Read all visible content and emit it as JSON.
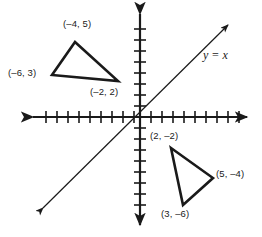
{
  "figure": {
    "name": "coordinate-plane-reflection-diagram",
    "background_color": "#ffffff",
    "stroke_color": "#1a1a1a",
    "width": 262,
    "height": 237
  },
  "axes": {
    "origin_px": [
      140,
      117
    ],
    "tick_spacing_px": 11,
    "x_axis": {
      "label": "",
      "arrow_left_px": [
        31,
        117
      ],
      "arrow_right_px": [
        249,
        117
      ],
      "tick_count_left": 9,
      "tick_count_right": 9
    },
    "y_axis": {
      "label": "",
      "arrow_top_px": [
        140,
        12
      ],
      "arrow_bottom_px": [
        140,
        227
      ],
      "tick_count_up": 8,
      "tick_count_down": 9
    }
  },
  "line": {
    "label": "y = x",
    "equation": "y = x",
    "slope": 1,
    "intercept": 0,
    "start_px": [
      43,
      208
    ],
    "end_px": [
      228,
      25
    ],
    "double_arrow": true
  },
  "shapes": [
    {
      "id": "triangle-preimage",
      "name": "triangle-upper-left",
      "vertices": [
        {
          "label": "(–4, 5)",
          "x": -4,
          "y": 5,
          "px": [
            75,
            42
          ]
        },
        {
          "label": "(–6, 3)",
          "x": -6,
          "y": 3,
          "px": [
            52,
            75
          ]
        },
        {
          "label": "(–2, 2)",
          "x": -2,
          "y": 2,
          "px": [
            118,
            81
          ]
        }
      ]
    },
    {
      "id": "triangle-image",
      "name": "triangle-lower-right",
      "vertices": [
        {
          "label": "(2, –2)",
          "x": 2,
          "y": -2,
          "px": [
            171,
            148
          ]
        },
        {
          "label": "(5, –4)",
          "x": 5,
          "y": -4,
          "px": [
            213,
            178
          ]
        },
        {
          "label": "(3, –6)",
          "x": 3,
          "y": -6,
          "px": [
            183,
            205
          ]
        }
      ]
    }
  ],
  "labels": [
    {
      "name": "label-neg4-5",
      "text": "(–4, 5)",
      "left": 63,
      "top": 19
    },
    {
      "name": "label-neg6-3",
      "text": "(–6, 3)",
      "left": 8,
      "top": 68
    },
    {
      "name": "label-neg2-2",
      "text": "(–2, 2)",
      "left": 90,
      "top": 87
    },
    {
      "name": "label-2-neg2",
      "text": "(2, –2)",
      "left": 150,
      "top": 131
    },
    {
      "name": "label-5-neg4",
      "text": "(5, –4)",
      "left": 216,
      "top": 169
    },
    {
      "name": "label-3-neg6",
      "text": "(3, –6)",
      "left": 161,
      "top": 209
    }
  ],
  "line_label": {
    "name": "label-y-equals-x",
    "text": "y = x",
    "left": 203,
    "top": 49
  }
}
